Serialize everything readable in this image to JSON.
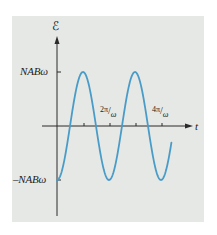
{
  "chart_data": {
    "type": "line",
    "title": "",
    "xlabel": "t",
    "ylabel": "ℰ",
    "function": "ℰ(t) = -NABω cos(ωt)",
    "x_ticks": [
      {
        "label": "2π/ω",
        "value": "2π/ω"
      },
      {
        "label": "4π/ω",
        "value": "4π/ω"
      }
    ],
    "x_minor_ticks": [
      "π/ω",
      "2π/ω",
      "3π/ω",
      "4π/ω"
    ],
    "y_ticks": [
      {
        "label": "NABω",
        "value": "NABω"
      },
      {
        "label": "–NABω",
        "value": "-NABω"
      }
    ],
    "x_range": [
      "0",
      "≈4.4π/ω"
    ],
    "y_range": [
      "-NABω",
      "NABω"
    ],
    "series": [
      {
        "name": "emf",
        "color": "#4a9cc8",
        "points_in_units_of_pi_over_omega": [
          {
            "t": 0,
            "emf": -1
          },
          {
            "t": 0.5,
            "emf": 0
          },
          {
            "t": 1,
            "emf": 1
          },
          {
            "t": 1.5,
            "emf": 0
          },
          {
            "t": 2,
            "emf": -1
          },
          {
            "t": 2.5,
            "emf": 0
          },
          {
            "t": 3,
            "emf": 1
          },
          {
            "t": 3.5,
            "emf": 0
          },
          {
            "t": 4,
            "emf": -1
          },
          {
            "t": 4.4,
            "emf": -0.54
          }
        ]
      }
    ],
    "grid": false,
    "legend": null
  },
  "labels": {
    "y_axis_title": "ℰ",
    "x_axis_title": "t",
    "y_max": "NABω",
    "y_min": "–NABω",
    "x_tick_1": {
      "num": "2π",
      "den": "ω"
    },
    "x_tick_2": {
      "num": "4π",
      "den": "ω"
    }
  },
  "colors": {
    "panel_bg": "#e6e8e5",
    "curve": "#4a9cc8",
    "axis": "#2a2a2a"
  }
}
